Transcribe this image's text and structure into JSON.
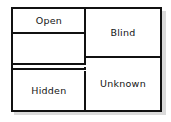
{
  "diagram": {
    "quadrants": [
      {
        "id": "open",
        "label": "Open",
        "position": "top-left"
      },
      {
        "id": "blind",
        "label": "Blind",
        "position": "top-right"
      },
      {
        "id": "hidden",
        "label": "Hidden",
        "position": "bottom-left"
      },
      {
        "id": "unknown",
        "label": "Unknown",
        "position": "bottom-right"
      }
    ],
    "transition": {
      "direction": "down",
      "arrow_count": 2,
      "from": "Open",
      "to": "Hidden"
    },
    "colors": {
      "line": "#111111",
      "background": "#ffffff",
      "text": "#141414",
      "shadow": "#bdbdbd"
    }
  }
}
